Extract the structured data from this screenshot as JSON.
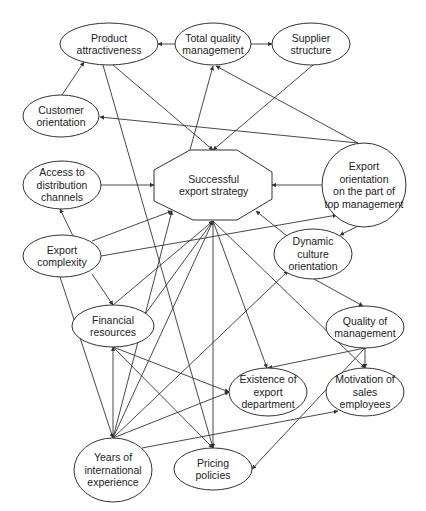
{
  "diagram": {
    "type": "causal influence diagram",
    "colors": {
      "stroke": "#333333",
      "text": "#222222",
      "background": "#ffffff"
    },
    "nodes": [
      {
        "id": "product_attractiveness",
        "shape": "ellipse",
        "cx": 109,
        "cy": 44,
        "rx": 49,
        "ry": 21,
        "lines": [
          "Product",
          "attractiveness"
        ]
      },
      {
        "id": "total_quality_management",
        "shape": "ellipse",
        "cx": 213,
        "cy": 44,
        "rx": 38,
        "ry": 21,
        "lines": [
          "Total quality",
          "management"
        ]
      },
      {
        "id": "supplier_structure",
        "shape": "ellipse",
        "cx": 311,
        "cy": 44,
        "rx": 39,
        "ry": 21,
        "lines": [
          "Supplier",
          "structure"
        ]
      },
      {
        "id": "customer_orientation",
        "shape": "ellipse",
        "cx": 61,
        "cy": 116,
        "rx": 38,
        "ry": 21,
        "lines": [
          "Customer",
          "orientation"
        ]
      },
      {
        "id": "access_distribution",
        "shape": "ellipse",
        "cx": 62,
        "cy": 185,
        "rx": 39,
        "ry": 24,
        "lines": [
          "Access to",
          "distribution",
          "channels"
        ]
      },
      {
        "id": "successful_export_strategy",
        "shape": "octagon",
        "points": "190,150 237,150 272,172 272,199 237,220 193,220 154,201 154,170",
        "lines": [
          "Successful",
          "export strategy"
        ]
      },
      {
        "id": "export_orientation_top_mgmt",
        "shape": "circle",
        "cx": 364,
        "cy": 185,
        "rx": 42,
        "ry": 42,
        "lines": [
          "Export",
          "orientation",
          "on the part of",
          "top management"
        ]
      },
      {
        "id": "export_complexity",
        "shape": "ellipse",
        "cx": 62,
        "cy": 256,
        "rx": 39,
        "ry": 21,
        "lines": [
          "Export",
          "complexity"
        ]
      },
      {
        "id": "dynamic_culture_orientation",
        "shape": "ellipse",
        "cx": 313,
        "cy": 254,
        "rx": 39,
        "ry": 25,
        "lines": [
          "Dynamic",
          "culture",
          "orientation"
        ]
      },
      {
        "id": "financial_resources",
        "shape": "ellipse",
        "cx": 113,
        "cy": 326,
        "rx": 41,
        "ry": 21,
        "lines": [
          "Financial",
          "resources"
        ]
      },
      {
        "id": "quality_of_management",
        "shape": "ellipse",
        "cx": 365,
        "cy": 327,
        "rx": 39,
        "ry": 21,
        "lines": [
          "Quality of",
          "management"
        ]
      },
      {
        "id": "existence_export_department",
        "shape": "ellipse",
        "cx": 268,
        "cy": 392,
        "rx": 39,
        "ry": 24,
        "lines": [
          "Existence of",
          "export",
          "department"
        ]
      },
      {
        "id": "motivation_sales_employees",
        "shape": "ellipse",
        "cx": 365,
        "cy": 392,
        "rx": 39,
        "ry": 24,
        "lines": [
          "Motivation of",
          "sales",
          "employees"
        ]
      },
      {
        "id": "years_international_experience",
        "shape": "ellipse",
        "cx": 113,
        "cy": 470,
        "rx": 39,
        "ry": 32,
        "lines": [
          "Years of",
          "international",
          "experience"
        ]
      },
      {
        "id": "pricing_policies",
        "shape": "ellipse",
        "cx": 213,
        "cy": 469,
        "rx": 39,
        "ry": 21,
        "lines": [
          "Pricing",
          "policies"
        ]
      }
    ],
    "edges": [
      {
        "from": "total_quality_management",
        "to": "product_attractiveness",
        "x1": 175,
        "y1": 44,
        "x2": 158,
        "y2": 44
      },
      {
        "from": "total_quality_management",
        "to": "supplier_structure",
        "x1": 251,
        "y1": 44,
        "x2": 272,
        "y2": 44
      },
      {
        "from": "customer_orientation",
        "to": "product_attractiveness",
        "x1": 62,
        "y1": 95,
        "x2": 84,
        "y2": 62
      },
      {
        "from": "supplier_structure",
        "to": "successful_export_strategy",
        "x1": 313,
        "y1": 65,
        "x2": 213,
        "y2": 150
      },
      {
        "from": "product_attractiveness",
        "to": "successful_export_strategy",
        "x1": 113,
        "y1": 65,
        "x2": 213,
        "y2": 150
      },
      {
        "from": "successful_export_strategy",
        "to": "total_quality_management",
        "x1": 190,
        "y1": 150,
        "x2": 213,
        "y2": 66
      },
      {
        "from": "export_orientation_top_mgmt",
        "to": "total_quality_management",
        "x1": 358,
        "y1": 143,
        "x2": 216,
        "y2": 66
      },
      {
        "from": "export_orientation_top_mgmt",
        "to": "customer_orientation",
        "x1": 358,
        "y1": 143,
        "x2": 100,
        "y2": 117
      },
      {
        "from": "access_distribution",
        "to": "successful_export_strategy",
        "x1": 101,
        "y1": 185,
        "x2": 154,
        "y2": 185
      },
      {
        "from": "export_orientation_top_mgmt",
        "to": "successful_export_strategy",
        "x1": 322,
        "y1": 185,
        "x2": 272,
        "y2": 185
      },
      {
        "from": "export_complexity",
        "to": "access_distribution",
        "x1": 73,
        "y1": 236,
        "x2": 60,
        "y2": 209
      },
      {
        "from": "export_complexity",
        "to": "successful_export_strategy",
        "x1": 92,
        "y1": 241,
        "x2": 172,
        "y2": 211
      },
      {
        "from": "export_complexity",
        "to": "export_orientation_top_mgmt",
        "x1": 101,
        "y1": 256,
        "x2": 337,
        "y2": 215
      },
      {
        "from": "export_orientation_top_mgmt",
        "to": "dynamic_culture_orientation",
        "x1": 358,
        "y1": 226,
        "x2": 340,
        "y2": 235
      },
      {
        "from": "dynamic_culture_orientation",
        "to": "successful_export_strategy",
        "x1": 287,
        "y1": 236,
        "x2": 256,
        "y2": 211
      },
      {
        "from": "dynamic_culture_orientation",
        "to": "quality_of_management",
        "x1": 314,
        "y1": 279,
        "x2": 363,
        "y2": 306
      },
      {
        "from": "export_complexity",
        "to": "financial_resources",
        "x1": 92,
        "y1": 274,
        "x2": 113,
        "y2": 305
      },
      {
        "from": "export_complexity",
        "to": "years_international_experience",
        "x1": 60,
        "y1": 277,
        "x2": 113,
        "y2": 438
      },
      {
        "from": "financial_resources",
        "to": "successful_export_strategy",
        "x1": 113,
        "y1": 305,
        "x2": 213,
        "y2": 221
      },
      {
        "from": "financial_resources",
        "to": "successful_export_strategy",
        "x1": 146,
        "y1": 313,
        "x2": 213,
        "y2": 221
      },
      {
        "from": "years_international_experience",
        "to": "successful_export_strategy",
        "x1": 113,
        "y1": 438,
        "x2": 213,
        "y2": 221
      },
      {
        "from": "years_international_experience",
        "to": "successful_export_strategy",
        "x1": 113,
        "y1": 438,
        "x2": 172,
        "y2": 211
      },
      {
        "from": "years_international_experience",
        "to": "dynamic_culture_orientation",
        "x1": 113,
        "y1": 438,
        "x2": 288,
        "y2": 271
      },
      {
        "from": "successful_export_strategy",
        "to": "pricing_policies",
        "x1": 213,
        "y1": 221,
        "x2": 213,
        "y2": 448
      },
      {
        "from": "successful_export_strategy",
        "to": "existence_export_department",
        "x1": 213,
        "y1": 221,
        "x2": 267,
        "y2": 368
      },
      {
        "from": "successful_export_strategy",
        "to": "motivation_sales_employees",
        "x1": 213,
        "y1": 221,
        "x2": 365,
        "y2": 368
      },
      {
        "from": "product_attractiveness",
        "to": "pricing_policies",
        "x1": 103,
        "y1": 65,
        "x2": 213,
        "y2": 448
      },
      {
        "from": "years_international_experience",
        "to": "financial_resources",
        "x1": 113,
        "y1": 438,
        "x2": 113,
        "y2": 347
      },
      {
        "from": "financial_resources",
        "to": "existence_export_department",
        "x1": 113,
        "y1": 347,
        "x2": 229,
        "y2": 392
      },
      {
        "from": "financial_resources",
        "to": "pricing_policies",
        "x1": 113,
        "y1": 347,
        "x2": 213,
        "y2": 448
      },
      {
        "from": "years_international_experience",
        "to": "existence_export_department",
        "x1": 113,
        "y1": 438,
        "x2": 229,
        "y2": 392
      },
      {
        "from": "years_international_experience",
        "to": "motivation_sales_employees",
        "x1": 142,
        "y1": 448,
        "x2": 338,
        "y2": 411
      },
      {
        "from": "quality_of_management",
        "to": "existence_export_department",
        "x1": 365,
        "y1": 348,
        "x2": 268,
        "y2": 368
      },
      {
        "from": "quality_of_management",
        "to": "motivation_sales_employees",
        "x1": 365,
        "y1": 348,
        "x2": 365,
        "y2": 368
      },
      {
        "from": "quality_of_management",
        "to": "pricing_policies",
        "x1": 365,
        "y1": 348,
        "x2": 252,
        "y2": 469
      }
    ]
  }
}
